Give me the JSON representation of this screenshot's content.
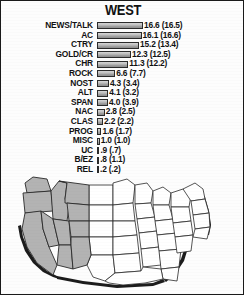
{
  "title": "WEST",
  "chart_data": {
    "type": "bar",
    "title": "WEST",
    "xlabel": "",
    "ylabel": "",
    "xlim": [
      0,
      16.6
    ],
    "grid": false,
    "legend": null,
    "orientation": "horizontal",
    "value_format": "current (previous)",
    "categories": [
      "NEWS/TALK",
      "AC",
      "CTRY",
      "GOLD/CR",
      "CHR",
      "ROCK",
      "NOST",
      "ALT",
      "SPAN",
      "NAC",
      "CLAS",
      "PROG",
      "MISC",
      "UC",
      "B/EZ",
      "REL"
    ],
    "values": [
      16.6,
      16.1,
      15.2,
      12.3,
      11.3,
      6.6,
      4.3,
      4.1,
      4.0,
      2.8,
      2.2,
      1.6,
      1.0,
      0.9,
      0.8,
      0.2
    ],
    "previous_values": [
      16.5,
      16.6,
      13.4,
      12.5,
      12.2,
      7.7,
      3.4,
      3.2,
      3.9,
      2.5,
      2.2,
      1.7,
      1.0,
      0.7,
      1.1,
      0.2
    ],
    "value_labels": [
      "16.6 (16.5)",
      "16.1 (16.6)",
      "15.2 (13.4)",
      "12.3 (12.5)",
      "11.3 (12.2)",
      "6.6 (7.7)",
      "4.3 (3.4)",
      "4.1 (3.2)",
      "4.0 (3.9)",
      "2.8 (2.5)",
      "2.2 (2.2)",
      "1.6 (1.7)",
      "1.0 (1.0)",
      ".9 (.7)",
      ".8 (1.1)",
      ".2 (.2)"
    ]
  },
  "map": {
    "name": "united-states-map",
    "highlighted_region": "WEST",
    "highlighted_states": [
      "WA",
      "OR",
      "CA",
      "NV",
      "ID",
      "MT",
      "WY",
      "UT",
      "CO",
      "AZ",
      "NM"
    ],
    "highlight_color": "#b3b3b3",
    "base_color": "#ffffff",
    "outline_color": "#2a2a2a"
  },
  "colors": {
    "bar_fill": "#c2c2c2",
    "bar_outline": "#2b2b2b",
    "text": "#111111",
    "frame": "#1a1a1a",
    "background": "#fdfdfd"
  }
}
